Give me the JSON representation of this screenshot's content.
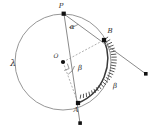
{
  "figure": {
    "background_color": "#ffffff",
    "stroke_color": "#8a8a8a",
    "accent_color": "#3a3a3a",
    "label_color": "#2b2b2b"
  },
  "labels": {
    "circle_name": "λ",
    "point_p": "P",
    "point_a": "A",
    "point_b": "B",
    "center_o": "O",
    "angle_alpha": "α",
    "angle_beta_center": "β",
    "arc_beta": "β"
  },
  "geometry": {
    "circle": {
      "cx": 63,
      "cy": 62,
      "r": 48
    },
    "points": {
      "P": {
        "x": 64,
        "y": 14,
        "marker": "square"
      },
      "B": {
        "x": 104,
        "y": 40,
        "marker": "square"
      },
      "A": {
        "x": 78,
        "y": 103,
        "marker": "square"
      },
      "O": {
        "x": 63,
        "y": 62,
        "marker": "dot"
      },
      "ray_pb_end": {
        "x": 146,
        "y": 74,
        "marker": "square"
      },
      "ray_pa_end": {
        "x": 80,
        "y": 123,
        "marker": "square"
      }
    },
    "arc_hatched": {
      "from": "B",
      "to": "A",
      "side": "right",
      "tick_count": 26
    },
    "dashed_segments": [
      [
        "O",
        "B"
      ],
      [
        "O",
        "A"
      ]
    ],
    "solid_rays": [
      [
        "P",
        "ray_pb_end"
      ],
      [
        "P",
        "ray_pa_end"
      ]
    ],
    "angles": {
      "alpha": {
        "vertex": "P",
        "between": [
          "PA",
          "PB"
        ]
      },
      "beta": {
        "vertex": "O",
        "between": [
          "OA",
          "OB"
        ]
      }
    }
  }
}
